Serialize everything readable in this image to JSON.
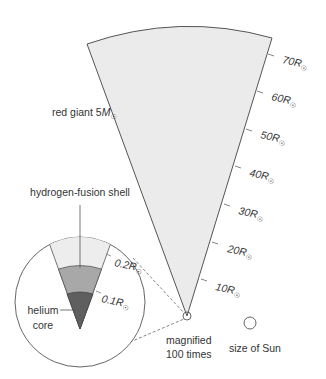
{
  "diagram": {
    "title_label": "red giant 5M",
    "title_label_parts": {
      "prefix": "red giant 5",
      "symbol": "M",
      "subscript": "☉"
    },
    "scale_ticks": [
      {
        "value": "10",
        "unit": "R",
        "subscript": "☉"
      },
      {
        "value": "20",
        "unit": "R",
        "subscript": "☉"
      },
      {
        "value": "30",
        "unit": "R",
        "subscript": "☉"
      },
      {
        "value": "40",
        "unit": "R",
        "subscript": "☉"
      },
      {
        "value": "50",
        "unit": "R",
        "subscript": "☉"
      },
      {
        "value": "60",
        "unit": "R",
        "subscript": "☉"
      },
      {
        "value": "70",
        "unit": "R",
        "subscript": "☉"
      }
    ],
    "magnified": {
      "line1": "magnified",
      "line2": "100 times"
    },
    "sun_label": "size of Sun",
    "inset": {
      "shell_label": "hydrogen-fusion shell",
      "core_label_line1": "helium",
      "core_label_line2": "core",
      "ticks": [
        {
          "value": "0.1",
          "unit": "R",
          "subscript": "☉"
        },
        {
          "value": "0.2",
          "unit": "R",
          "subscript": "☉"
        }
      ]
    },
    "colors": {
      "wedge_fill": "#ebebeb",
      "outline": "#555555",
      "shell_outer": "#ededed",
      "shell_mid": "#a8a8a8",
      "core": "#5f5f5f",
      "text": "#333333"
    }
  }
}
